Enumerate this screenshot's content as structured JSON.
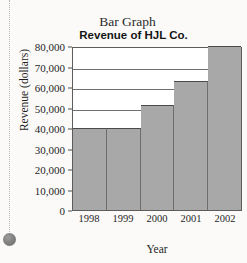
{
  "scan": {
    "cutoff_text_fragment": "",
    "bullet_icon": "filled-circle-bullet"
  },
  "figure": {
    "label": "Bar Graph",
    "title": "Revenue of HJL Co."
  },
  "chart_data": {
    "type": "bar",
    "title": "Revenue of HJL Co.",
    "subtitle": "Bar Graph",
    "categories": [
      "1998",
      "1999",
      "2000",
      "2001",
      "2002"
    ],
    "values": [
      40000,
      40000,
      51000,
      63000,
      80000
    ],
    "xlabel": "Year",
    "ylabel": "Revenue (dollars)",
    "ylim": [
      0,
      80000
    ],
    "ytick_labels": [
      "80,000",
      "70,000",
      "60,000",
      "50,000",
      "40,000",
      "30,000",
      "20,000",
      "10,000",
      "0"
    ],
    "ytick_values": [
      80000,
      70000,
      60000,
      50000,
      40000,
      30000,
      20000,
      10000,
      0
    ],
    "grid": true,
    "grid_axis": "y",
    "legend": false,
    "bar_color": "#a8a8a8",
    "bar_edge_color": "#4a4a4a",
    "plot_background": "#ffffff",
    "bar_gap": 0
  }
}
